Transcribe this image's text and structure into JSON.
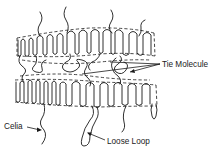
{
  "diagram": {
    "type": "polymer-lamellae-schematic",
    "labels": {
      "tie_molecule": "Tie Molecule",
      "celia": "Celia",
      "loose_loop": "Loose Loop"
    },
    "colors": {
      "line": "#1a1a1a",
      "background": "#ffffff"
    },
    "structures": [
      "upper-lamella",
      "lower-lamella",
      "amorphous-interlayer",
      "tie-molecules",
      "cilia",
      "loose-loop"
    ]
  }
}
